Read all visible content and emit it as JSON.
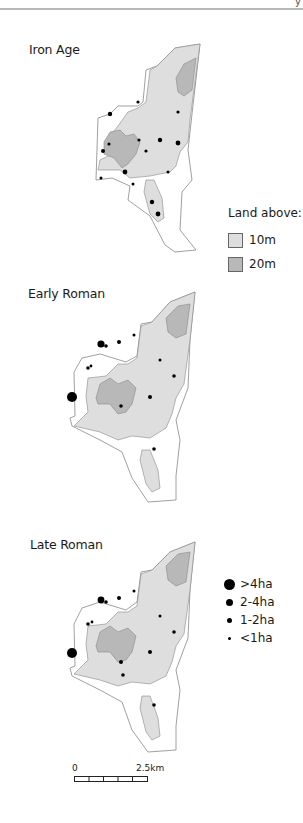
{
  "header": {
    "page_fragment": "y"
  },
  "panels": [
    {
      "title": "Iron Age"
    },
    {
      "title": "Early Roman"
    },
    {
      "title": "Late Roman"
    }
  ],
  "legend_elevation": {
    "title": "Land above:",
    "items": [
      {
        "label": "10m",
        "color": "#dedede"
      },
      {
        "label": "20m",
        "color": "#b8b8b8"
      }
    ]
  },
  "legend_sites": {
    "items": [
      {
        "label": ">4ha",
        "size": 11
      },
      {
        "label": "2-4ha",
        "size": 7
      },
      {
        "label": "1-2ha",
        "size": 5
      },
      {
        "label": "<1ha",
        "size": 3
      }
    ]
  },
  "scale_bar": {
    "start": "0",
    "end": "2.5km",
    "segments": 5
  },
  "colors": {
    "land10": "#dedede",
    "land20": "#b8b8b8",
    "outline": "#888888",
    "site": "#000000"
  }
}
